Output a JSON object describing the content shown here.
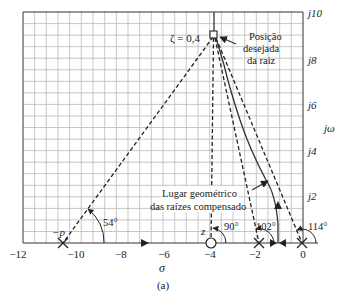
{
  "figure": {
    "caption": "(a)",
    "x_axis_label": "σ",
    "y_axis_label": "jω",
    "x_ticks": [
      "−12",
      "−10",
      "−8",
      "−6",
      "−4",
      "−2",
      "0"
    ],
    "y_ticks": [
      "j2",
      "j4",
      "j6",
      "j8",
      "j10"
    ],
    "zeta_label": "ζ = 0,4",
    "desired_root_label": [
      "Posição",
      "desejada",
      "da raiz"
    ],
    "locus_label": [
      "Lugar geométrico",
      "das raízes compensado"
    ],
    "pole_p_label": "−p",
    "zero_label": "z",
    "angles": [
      "54°",
      "90°",
      "102°",
      "114°"
    ]
  },
  "colors": {
    "grid": "#b9b9b9",
    "lines": "#222222",
    "background": "#ffffff"
  }
}
